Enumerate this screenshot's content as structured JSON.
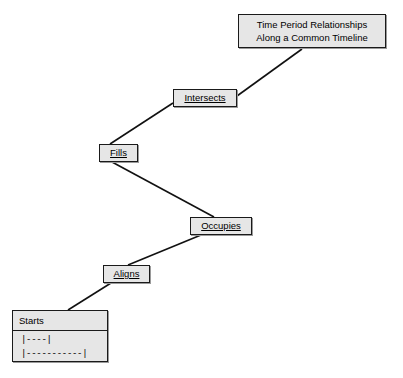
{
  "diagram": {
    "type": "hierarchy-zigzag",
    "title_node": {
      "label_line1": "Time Period Relationships",
      "label_line2": "Along a Common Timeline"
    },
    "nodes": [
      {
        "id": "intersects",
        "label": "Intersects",
        "underlined": true
      },
      {
        "id": "fills",
        "label": "Fills",
        "underlined": true
      },
      {
        "id": "occupies",
        "label": "Occupies",
        "underlined": true
      },
      {
        "id": "aligns",
        "label": "Aligns",
        "underlined": true
      }
    ],
    "class_box": {
      "header": "Starts",
      "rows": [
        "|----|",
        "|-----------|"
      ]
    },
    "colors": {
      "node_fill": "#e6e6e6",
      "node_border": "#1a1a1a",
      "edge": "#111111",
      "background": "#ffffff",
      "text": "#000000"
    }
  }
}
